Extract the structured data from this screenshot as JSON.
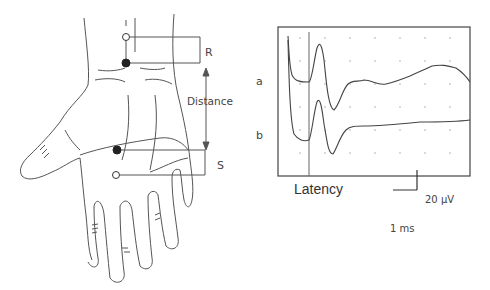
{
  "hand_diagram": {
    "labels": {
      "recording": "R",
      "stimulation": "S",
      "distance": "Distance"
    },
    "electrodes": [
      {
        "name": "recording-reference",
        "type": "open"
      },
      {
        "name": "recording-active",
        "type": "filled"
      },
      {
        "name": "stimulation-cathode",
        "type": "filled"
      },
      {
        "name": "stimulation-anode",
        "type": "open"
      }
    ]
  },
  "trace_panel": {
    "trace_labels": {
      "a": "a",
      "b": "b"
    },
    "latency_label": "Latency",
    "scale_bar": {
      "amplitude": "20 µV",
      "time": "1 ms"
    }
  },
  "colors": {
    "line": "#555555",
    "frame": "#444444",
    "dot": "#999999"
  }
}
